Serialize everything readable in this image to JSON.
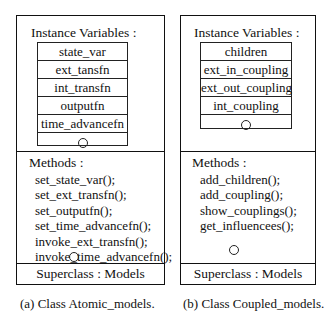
{
  "left_class": {
    "instance_header": "Instance Variables :",
    "variables": [
      "state_var",
      "ext_tansfn",
      "int_transfn",
      "outputfn",
      "time_advancefn"
    ],
    "methods_header": "Methods :",
    "methods": [
      "set_state_var();",
      "set_ext_transfn();",
      "set_outputfn();",
      "set_time_advancefn();",
      "invoke_ext_transfn();",
      "invoke_time_advancefn();"
    ],
    "superclass": "Superclass : Models",
    "caption": "(a) Class Atomic_models."
  },
  "right_class": {
    "instance_header": "Instance Variables :",
    "variables": [
      "children",
      "ext_in_coupling",
      "ext_out_coupling",
      "int_coupling"
    ],
    "methods_header": "Methods :",
    "methods": [
      "add_children();",
      "add_coupling();",
      "show_couplings();",
      "get_influencees();"
    ],
    "superclass": "Superclass : Models",
    "caption": "(b) Class Coupled_models."
  }
}
